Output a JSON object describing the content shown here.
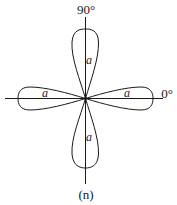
{
  "diagram": {
    "type": "polar-pattern",
    "angle_labels": {
      "top": "90°",
      "right": "0°"
    },
    "lobe_labels": {
      "top": "a",
      "bottom": "a",
      "left": "a",
      "right": "a"
    },
    "caption": "(n)",
    "colors": {
      "stroke": "#1a1a1a",
      "background": "#ffffff"
    }
  }
}
